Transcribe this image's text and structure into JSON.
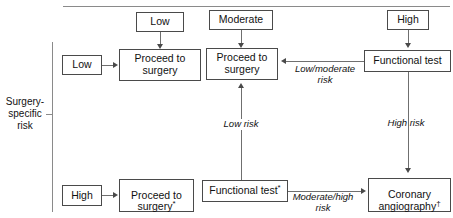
{
  "figure": {
    "type": "clinical-decision-flowchart",
    "axis_label_left": "Surgery-\nspecific\nrisk",
    "colors": {
      "box_border": "#4a4a4a",
      "connector": "#6f6f6f",
      "rule": "#8a8a8a",
      "text": "#111111",
      "background": "#ffffff"
    }
  },
  "nodes": {
    "col1_risk_top": "Low",
    "col1_risk_left": "Low",
    "col1_action": "Proceed to\nsurgery",
    "col2_risk_top": "Moderate",
    "col2_action": "Proceed to\nsurgery",
    "col3_risk_top": "High",
    "col3_action": "Functional test",
    "row2_risk_left": "High",
    "row2_action": "Proceed to\nsurgery*",
    "row2_test": "Functional test*",
    "row2_outcome": "Coronary\nangiography†"
  },
  "edge_labels": {
    "low_moderate_risk": "Low/moderate\nrisk",
    "low_risk": "Low risk",
    "high_risk": "High risk",
    "moderate_high_risk": "Moderate/high\nrisk"
  }
}
